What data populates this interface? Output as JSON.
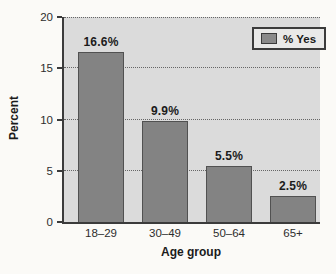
{
  "chart_data": {
    "type": "bar",
    "categories": [
      "18–29",
      "30–49",
      "50–64",
      "65+"
    ],
    "values": [
      16.6,
      9.9,
      5.5,
      2.5
    ],
    "data_labels": [
      "16.6%",
      "9.9%",
      "5.5%",
      "2.5%"
    ],
    "xlabel": "Age group",
    "ylabel": "Percent",
    "ylim": [
      0,
      20
    ],
    "yticks": [
      0,
      5,
      10,
      15,
      20
    ],
    "grid": "horizontal dotted lines at each y tick, plot top edge is the 20 gridline",
    "legend": {
      "position": "top-right",
      "entries": [
        {
          "label": "% Yes",
          "color": "#8a8a8a"
        }
      ]
    },
    "colors": {
      "bar_fill": "#838383",
      "bar_border": "#515151",
      "plot_background": "#dbdbdb",
      "page_background": "#fbfaf7",
      "axis": "#3b3b3b",
      "gridline": "#666666",
      "text": "#1b1b1b",
      "legend_background": "#e9e9e8"
    }
  }
}
